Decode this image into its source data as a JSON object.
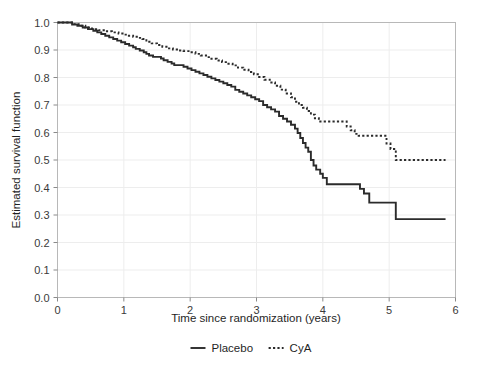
{
  "chart_data": {
    "type": "line",
    "subtype": "kaplan-meier-step",
    "title": "",
    "xlabel": "Time since randomization (years)",
    "ylabel": "Estimated survival function",
    "xlim": [
      0,
      6
    ],
    "ylim": [
      0,
      1
    ],
    "xticks": [
      "0",
      "1",
      "2",
      "3",
      "4",
      "5",
      "6"
    ],
    "xtick_values": [
      0,
      1,
      2,
      3,
      4,
      5,
      6
    ],
    "yticks": [
      "0.0",
      "0.1",
      "0.2",
      "0.3",
      "0.4",
      "0.5",
      "0.6",
      "0.7",
      "0.8",
      "0.9",
      "1.0"
    ],
    "ytick_values": [
      0.0,
      0.1,
      0.2,
      0.3,
      0.4,
      0.5,
      0.6,
      0.7,
      0.8,
      0.9,
      1.0
    ],
    "grid": true,
    "legend_position": "bottom",
    "series": [
      {
        "name": "Placebo",
        "style": "solid",
        "color": "#2b2b2b",
        "final_value": 0.285,
        "points": [
          [
            0.0,
            1.0
          ],
          [
            0.18,
            1.0
          ],
          [
            0.22,
            0.993
          ],
          [
            0.3,
            0.988
          ],
          [
            0.38,
            0.982
          ],
          [
            0.46,
            0.976
          ],
          [
            0.54,
            0.97
          ],
          [
            0.6,
            0.964
          ],
          [
            0.66,
            0.958
          ],
          [
            0.72,
            0.952
          ],
          [
            0.78,
            0.946
          ],
          [
            0.84,
            0.94
          ],
          [
            0.9,
            0.934
          ],
          [
            0.96,
            0.928
          ],
          [
            1.02,
            0.922
          ],
          [
            1.08,
            0.916
          ],
          [
            1.14,
            0.91
          ],
          [
            1.18,
            0.904
          ],
          [
            1.24,
            0.898
          ],
          [
            1.3,
            0.892
          ],
          [
            1.34,
            0.886
          ],
          [
            1.38,
            0.88
          ],
          [
            1.44,
            0.875
          ],
          [
            1.5,
            0.875
          ],
          [
            1.56,
            0.869
          ],
          [
            1.6,
            0.863
          ],
          [
            1.66,
            0.857
          ],
          [
            1.72,
            0.851
          ],
          [
            1.76,
            0.845
          ],
          [
            1.82,
            0.845
          ],
          [
            1.9,
            0.839
          ],
          [
            1.96,
            0.833
          ],
          [
            2.02,
            0.827
          ],
          [
            2.08,
            0.821
          ],
          [
            2.14,
            0.815
          ],
          [
            2.2,
            0.809
          ],
          [
            2.26,
            0.803
          ],
          [
            2.32,
            0.797
          ],
          [
            2.38,
            0.791
          ],
          [
            2.44,
            0.785
          ],
          [
            2.5,
            0.779
          ],
          [
            2.56,
            0.773
          ],
          [
            2.62,
            0.767
          ],
          [
            2.68,
            0.755
          ],
          [
            2.74,
            0.748
          ],
          [
            2.8,
            0.742
          ],
          [
            2.86,
            0.735
          ],
          [
            2.92,
            0.728
          ],
          [
            2.98,
            0.721
          ],
          [
            3.04,
            0.714
          ],
          [
            3.1,
            0.7
          ],
          [
            3.16,
            0.692
          ],
          [
            3.22,
            0.684
          ],
          [
            3.28,
            0.676
          ],
          [
            3.34,
            0.66
          ],
          [
            3.4,
            0.65
          ],
          [
            3.46,
            0.64
          ],
          [
            3.52,
            0.628
          ],
          [
            3.58,
            0.614
          ],
          [
            3.62,
            0.598
          ],
          [
            3.66,
            0.58
          ],
          [
            3.7,
            0.562
          ],
          [
            3.74,
            0.545
          ],
          [
            3.78,
            0.53
          ],
          [
            3.82,
            0.5
          ],
          [
            3.86,
            0.48
          ],
          [
            3.9,
            0.465
          ],
          [
            3.96,
            0.45
          ],
          [
            4.0,
            0.435
          ],
          [
            4.06,
            0.412
          ],
          [
            4.5,
            0.412
          ],
          [
            4.56,
            0.395
          ],
          [
            4.62,
            0.378
          ],
          [
            4.7,
            0.345
          ],
          [
            5.05,
            0.345
          ],
          [
            5.1,
            0.285
          ],
          [
            5.85,
            0.285
          ]
        ]
      },
      {
        "name": "CyA",
        "style": "dotted",
        "color": "#2b2b2b",
        "final_value": 0.5,
        "points": [
          [
            0.0,
            1.0
          ],
          [
            0.18,
            1.0
          ],
          [
            0.24,
            0.994
          ],
          [
            0.32,
            0.988
          ],
          [
            0.42,
            0.982
          ],
          [
            0.52,
            0.976
          ],
          [
            0.62,
            0.972
          ],
          [
            0.72,
            0.968
          ],
          [
            0.82,
            0.964
          ],
          [
            0.92,
            0.96
          ],
          [
            1.0,
            0.956
          ],
          [
            1.06,
            0.952
          ],
          [
            1.14,
            0.948
          ],
          [
            1.22,
            0.944
          ],
          [
            1.28,
            0.94
          ],
          [
            1.34,
            0.93
          ],
          [
            1.42,
            0.924
          ],
          [
            1.5,
            0.918
          ],
          [
            1.58,
            0.912
          ],
          [
            1.66,
            0.906
          ],
          [
            1.74,
            0.902
          ],
          [
            1.82,
            0.898
          ],
          [
            1.9,
            0.896
          ],
          [
            2.0,
            0.892
          ],
          [
            2.08,
            0.886
          ],
          [
            2.16,
            0.88
          ],
          [
            2.24,
            0.874
          ],
          [
            2.32,
            0.868
          ],
          [
            2.4,
            0.862
          ],
          [
            2.48,
            0.856
          ],
          [
            2.56,
            0.85
          ],
          [
            2.64,
            0.844
          ],
          [
            2.72,
            0.836
          ],
          [
            2.8,
            0.828
          ],
          [
            2.88,
            0.82
          ],
          [
            2.96,
            0.812
          ],
          [
            3.04,
            0.802
          ],
          [
            3.12,
            0.792
          ],
          [
            3.2,
            0.782
          ],
          [
            3.28,
            0.77
          ],
          [
            3.36,
            0.756
          ],
          [
            3.44,
            0.742
          ],
          [
            3.52,
            0.728
          ],
          [
            3.58,
            0.712
          ],
          [
            3.64,
            0.7
          ],
          [
            3.7,
            0.69
          ],
          [
            3.76,
            0.678
          ],
          [
            3.82,
            0.665
          ],
          [
            3.88,
            0.652
          ],
          [
            3.94,
            0.64
          ],
          [
            4.3,
            0.64
          ],
          [
            4.36,
            0.622
          ],
          [
            4.42,
            0.608
          ],
          [
            4.48,
            0.595
          ],
          [
            4.54,
            0.588
          ],
          [
            4.9,
            0.588
          ],
          [
            4.96,
            0.56
          ],
          [
            5.02,
            0.54
          ],
          [
            5.1,
            0.5
          ],
          [
            5.85,
            0.5
          ]
        ]
      }
    ]
  },
  "legend": {
    "items": [
      {
        "label": "Placebo",
        "style": "solid"
      },
      {
        "label": "CyA",
        "style": "dotted"
      }
    ]
  }
}
